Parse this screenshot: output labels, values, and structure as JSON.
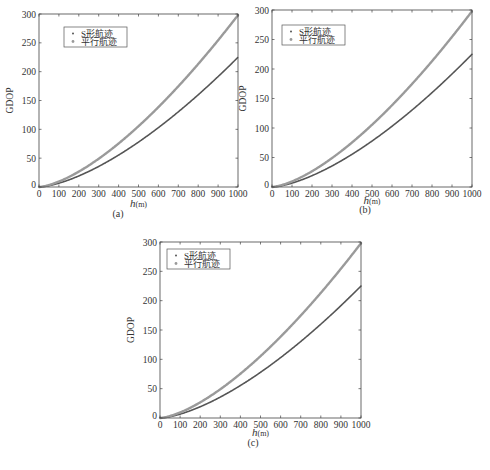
{
  "figure": {
    "panels": [
      {
        "id": "a",
        "caption": "(a)"
      },
      {
        "id": "b",
        "caption": "(b)"
      },
      {
        "id": "c",
        "caption": "(c)"
      }
    ]
  },
  "chart_data": [
    {
      "type": "scatter",
      "panel": "(a)",
      "xlabel": "h(m)",
      "ylabel": "GDOP",
      "xlim": [
        0,
        1000
      ],
      "ylim": [
        0,
        300
      ],
      "xticks": [
        0,
        100,
        200,
        300,
        400,
        500,
        600,
        700,
        800,
        900,
        1000
      ],
      "yticks": [
        0,
        50,
        100,
        150,
        200,
        250,
        300
      ],
      "grid": false,
      "legend_position": "upper left",
      "x": [
        0,
        100,
        200,
        300,
        400,
        500,
        600,
        700,
        800,
        900,
        1000
      ],
      "series": [
        {
          "name": "S形航迹",
          "color": "#555555",
          "marker": ".",
          "values": [
            0,
            6.6,
            19.3,
            35.8,
            55.5,
            77.9,
            102.7,
            130.0,
            159.5,
            191.0,
            225.0
          ]
        },
        {
          "name": "平行航迹",
          "color": "#9a9a9a",
          "marker": "*",
          "values": [
            0,
            9.4,
            26.7,
            49.0,
            75.4,
            105.4,
            138.5,
            174.5,
            213.2,
            254.4,
            298.0
          ]
        }
      ]
    },
    {
      "type": "scatter",
      "panel": "(b)",
      "xlabel": "h(m)",
      "ylabel": "GDOP",
      "xlim": [
        0,
        1000
      ],
      "ylim": [
        0,
        300
      ],
      "xticks": [
        0,
        100,
        200,
        300,
        400,
        500,
        600,
        700,
        800,
        900,
        1000
      ],
      "yticks": [
        0,
        50,
        100,
        150,
        200,
        250,
        300
      ],
      "grid": false,
      "legend_position": "upper left",
      "x": [
        0,
        100,
        200,
        300,
        400,
        500,
        600,
        700,
        800,
        900,
        1000
      ],
      "series": [
        {
          "name": "S形航迹",
          "color": "#555555",
          "marker": ".",
          "values": [
            0,
            6.6,
            19.3,
            35.8,
            55.5,
            77.9,
            102.7,
            130.0,
            159.5,
            191.0,
            225.0
          ]
        },
        {
          "name": "平行航迹",
          "color": "#9a9a9a",
          "marker": "*",
          "values": [
            0,
            9.4,
            26.7,
            49.0,
            75.4,
            105.4,
            138.5,
            174.5,
            213.2,
            254.4,
            298.0
          ]
        }
      ]
    },
    {
      "type": "scatter",
      "panel": "(c)",
      "xlabel": "h(m)",
      "ylabel": "GDOP",
      "xlim": [
        0,
        1000
      ],
      "ylim": [
        0,
        300
      ],
      "xticks": [
        0,
        100,
        200,
        300,
        400,
        500,
        600,
        700,
        800,
        900,
        1000
      ],
      "yticks": [
        0,
        50,
        100,
        150,
        200,
        250,
        300
      ],
      "grid": false,
      "legend_position": "upper left",
      "x": [
        0,
        100,
        200,
        300,
        400,
        500,
        600,
        700,
        800,
        900,
        1000
      ],
      "series": [
        {
          "name": "S形航迹",
          "color": "#555555",
          "marker": ".",
          "values": [
            0,
            6.6,
            19.3,
            35.8,
            55.5,
            77.9,
            102.7,
            130.0,
            159.5,
            191.0,
            225.0
          ]
        },
        {
          "name": "平行航迹",
          "color": "#9a9a9a",
          "marker": "*",
          "values": [
            0,
            9.4,
            26.7,
            49.0,
            75.4,
            105.4,
            138.5,
            174.5,
            213.2,
            254.4,
            298.0
          ]
        }
      ]
    }
  ],
  "layout": {
    "panels": [
      {
        "left": 39,
        "top": 14,
        "right": 238,
        "bottom": 187,
        "legend": {
          "x": 64,
          "y": 27,
          "w": 63,
          "h": 20
        },
        "caption_x": 118,
        "caption_y": 217,
        "xlabel_y": 207
      },
      {
        "left": 272,
        "top": 10,
        "right": 472,
        "bottom": 187,
        "legend": {
          "x": 282,
          "y": 25,
          "w": 63,
          "h": 20
        },
        "caption_x": 365,
        "caption_y": 213,
        "xlabel_y": 204
      },
      {
        "left": 160,
        "top": 242,
        "right": 361,
        "bottom": 418,
        "legend": {
          "x": 167,
          "y": 249,
          "w": 63,
          "h": 20
        },
        "caption_x": 253,
        "caption_y": 446,
        "xlabel_y": 436
      }
    ]
  }
}
